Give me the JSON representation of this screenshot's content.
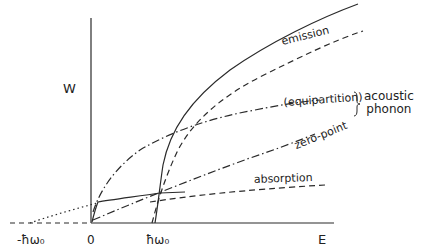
{
  "figure": {
    "axes": {
      "y_label": "W",
      "x_label": "E",
      "x_ticks": [
        {
          "label": "-ħω₀",
          "position": "negative phonon energy"
        },
        {
          "label": "0",
          "position": "origin"
        },
        {
          "label": "ħω₀",
          "position": "positive phonon energy"
        }
      ]
    },
    "curves": [
      {
        "id": "emission-solid",
        "style": "solid",
        "label": "emission",
        "group": "optical"
      },
      {
        "id": "emission-dashed",
        "style": "dashed",
        "label": "emission"
      },
      {
        "id": "absorption-solid",
        "style": "solid",
        "label": "absorption"
      },
      {
        "id": "absorption-dashed",
        "style": "dashed",
        "label": "absorption"
      },
      {
        "id": "equipartition",
        "style": "dash-dot",
        "label": "(equipartition)"
      },
      {
        "id": "zero-point",
        "style": "dash-dot",
        "label": "zero-point"
      },
      {
        "id": "negative-extension",
        "style": "dotted",
        "label": ""
      }
    ],
    "labels": {
      "emission": "emission",
      "equipartition": "(equipartition)",
      "zero_point": "zero-point",
      "absorption": "absorption",
      "group_line1": "acoustic",
      "group_line2": "phonon"
    },
    "colors": {
      "ink": "#2a2a2a",
      "background": "#ffffff"
    }
  }
}
